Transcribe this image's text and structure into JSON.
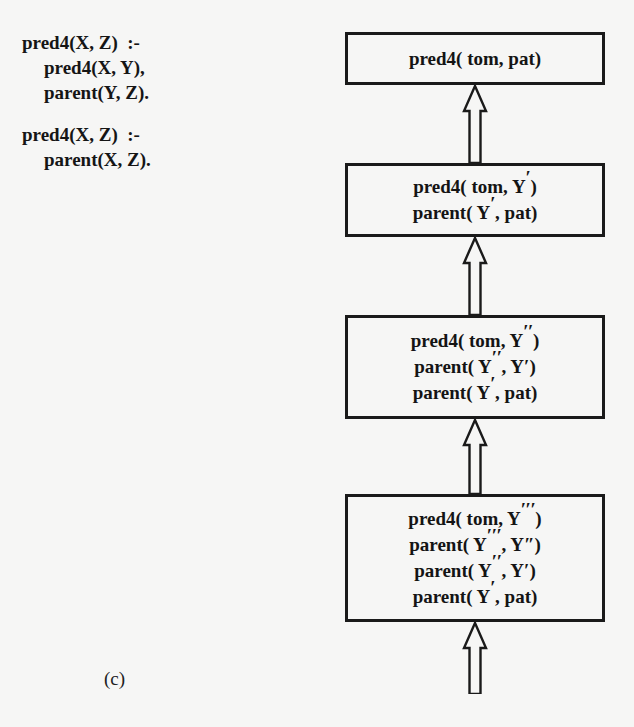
{
  "figure": {
    "caption": "(c)"
  },
  "program": {
    "clauses": [
      {
        "lines": [
          {
            "text": "pred4(X, Z)  :-",
            "indent": false
          },
          {
            "text": "pred4(X, Y),",
            "indent": true
          },
          {
            "text": "parent(Y, Z).",
            "indent": true
          }
        ]
      },
      {
        "lines": [
          {
            "text": "pred4(X, Z)  :-",
            "indent": false
          },
          {
            "text": "parent(X, Z).",
            "indent": true
          }
        ]
      }
    ]
  },
  "derivation": {
    "arrow": {
      "color": "#1a1a1a",
      "style": "hollow-outline-up-arrow"
    },
    "goals": [
      {
        "id": "goal-1",
        "lines": [
          {
            "prefix": "pred4( tom, pat)",
            "primes": 0,
            "suffix": ""
          }
        ]
      },
      {
        "id": "goal-2",
        "lines": [
          {
            "prefix": "pred4( tom, Y",
            "primes": 1,
            "suffix": ")"
          },
          {
            "prefix": "parent( Y",
            "primes": 1,
            "suffix": ", pat)"
          }
        ]
      },
      {
        "id": "goal-3",
        "lines": [
          {
            "prefix": "pred4( tom, Y",
            "primes": 2,
            "suffix": ")"
          },
          {
            "prefix": "parent( Y",
            "primes": 2,
            "suffix": ", Y′)"
          },
          {
            "prefix": "parent( Y",
            "primes": 1,
            "suffix": ", pat)"
          }
        ]
      },
      {
        "id": "goal-4",
        "lines": [
          {
            "prefix": "pred4( tom, Y",
            "primes": 3,
            "suffix": ")"
          },
          {
            "prefix": "parent( Y",
            "primes": 3,
            "suffix": ", Y″)"
          },
          {
            "prefix": "parent( Y",
            "primes": 2,
            "suffix": ", Y′)"
          },
          {
            "prefix": "parent( Y",
            "primes": 1,
            "suffix": ", pat)"
          }
        ]
      }
    ]
  }
}
